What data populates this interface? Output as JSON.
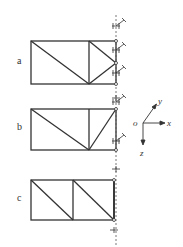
{
  "diagram": {
    "type": "truss-configurations",
    "panels": [
      {
        "label": "a",
        "description": "truss with two diagonals in right panel, three supports on right"
      },
      {
        "label": "b",
        "description": "truss with two diagonals meeting at bottom vertical node, two supports on right"
      },
      {
        "label": "c",
        "description": "two-panel truss with parallel diagonals, two supports on right"
      }
    ],
    "axes": {
      "origin": "o",
      "x": "x",
      "y": "y",
      "z": "z"
    }
  },
  "colors": {
    "line": "#333333",
    "dash": "#555555",
    "background": "#ffffff"
  }
}
